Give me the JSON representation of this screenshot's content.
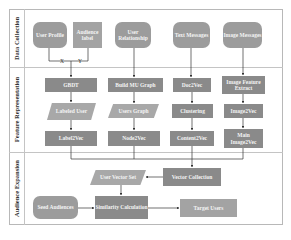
{
  "lanes": [
    {
      "label": "Data Collection"
    },
    {
      "label": "Feature Representation"
    },
    {
      "label": "Audience Expansion"
    }
  ],
  "data_collection": {
    "user_profile": "User Profile",
    "audience_label": "Audience label",
    "user_relationship": "User Relationship",
    "text_messages": "Text Messages",
    "image_messages": "Image Messages",
    "join_x": "X",
    "join_y": "Y"
  },
  "feature_representation": {
    "gbdt": "GBDT",
    "labeled_user": "Labeled User",
    "label2vec": "Label2Vec",
    "build_mu_graph": "Build MU Graph",
    "users_graph": "Users Graph",
    "node2vec": "Node2Vec",
    "doc2vec": "Doc2Vec",
    "clustering": "Clustering",
    "content2vec": "Content2Vec",
    "image_feature_extract": "Image Feature Extract",
    "image2vec": "Image2Vec",
    "main_image2vec": "Main Image2Vec"
  },
  "audience_expansion": {
    "user_vector_set": "User Vector Set",
    "vector_collection": "Vector Collection",
    "seed_audiences": "Seed Audiences",
    "similarity_calculation": "Similarity Calculation",
    "target_users": "Target Users"
  },
  "colors": {
    "node_fill": "#8a8a8a",
    "rounded_fill": "#9c9c9c",
    "parallelogram_fill": "#a8a8a8",
    "lane_border": "#c4c4c4",
    "arrow": "#333333"
  }
}
